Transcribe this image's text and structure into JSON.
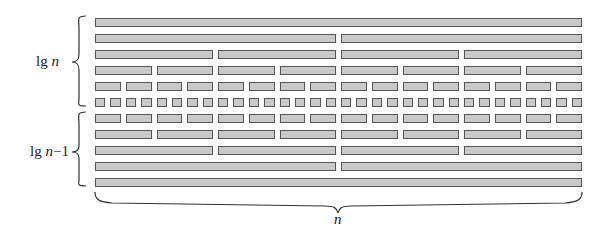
{
  "diagram": {
    "rows": [
      {
        "level": 0,
        "segments": 1
      },
      {
        "level": 1,
        "segments": 2
      },
      {
        "level": 2,
        "segments": 4
      },
      {
        "level": 3,
        "segments": 8
      },
      {
        "level": 4,
        "segments": 16
      },
      {
        "level": 5,
        "segments": 32
      },
      {
        "level": 6,
        "segments": 16
      },
      {
        "level": 7,
        "segments": 8
      },
      {
        "level": 8,
        "segments": 4
      },
      {
        "level": 9,
        "segments": 2
      },
      {
        "level": 10,
        "segments": 1
      }
    ],
    "labels": {
      "top_brace": {
        "prefix": "lg ",
        "var": "n",
        "suffix": ""
      },
      "bottom_brace": {
        "prefix": "lg ",
        "var": "n",
        "suffix": "−1"
      },
      "width_brace": {
        "var": "n"
      }
    },
    "colors": {
      "bar_fill": "#c9c9c9",
      "bar_border": "#555555",
      "brace": "#333333"
    },
    "layout": {
      "x_left": 95,
      "x_right": 582,
      "y_first": 18,
      "row_step": 16,
      "bar_height": 7,
      "gap": 5
    }
  }
}
